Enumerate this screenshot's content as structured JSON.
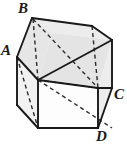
{
  "figure": {
    "name": "labeled-solid-diagram",
    "background_color": "#ffffff",
    "stroke_color": "#1a1a1a",
    "hidden_edge_style": "dashed",
    "face_fill_top": "#e8e8e8",
    "face_fill_side": "#efefef",
    "face_fill_front": "#ffffff",
    "labels": [
      {
        "id": "A",
        "text": "A",
        "x": 1,
        "y": 43
      },
      {
        "id": "B",
        "text": "B",
        "x": 18,
        "y": 1
      },
      {
        "id": "C",
        "text": "C",
        "x": 114,
        "y": 87
      },
      {
        "id": "D",
        "text": "D",
        "x": 96,
        "y": 129
      }
    ],
    "vertices": {
      "A": {
        "x": 17,
        "y": 57
      },
      "B": {
        "x": 32,
        "y": 18
      },
      "C": {
        "x": 112,
        "y": 88
      },
      "D": {
        "x": 98,
        "y": 128
      }
    }
  }
}
